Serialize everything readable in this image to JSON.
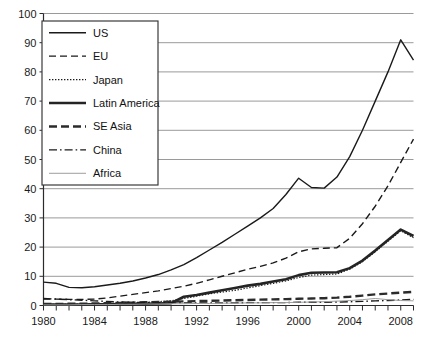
{
  "chart_data": {
    "type": "line",
    "title": "",
    "subtitle": "",
    "xlabel": "",
    "ylabel": "",
    "xlim": [
      1980,
      2009
    ],
    "ylim": [
      0,
      100
    ],
    "yticks": [
      0,
      10,
      20,
      30,
      40,
      50,
      60,
      70,
      80,
      90,
      100
    ],
    "ytick_labels": [
      "0",
      "10",
      "20",
      "30",
      "40",
      "50",
      "60",
      "70",
      "80",
      "90",
      "100"
    ],
    "xticks": [
      1980,
      1981,
      1982,
      1983,
      1984,
      1985,
      1986,
      1987,
      1988,
      1989,
      1990,
      1991,
      1992,
      1993,
      1994,
      1995,
      1996,
      1997,
      1998,
      1999,
      2000,
      2001,
      2002,
      2003,
      2004,
      2005,
      2006,
      2007,
      2008,
      2009
    ],
    "xtick_labels_shown": [
      "1980",
      "1984",
      "1988",
      "1992",
      "1996",
      "2000",
      "2004",
      "2008"
    ],
    "xtick_label_years": [
      1980,
      1984,
      1988,
      1992,
      1996,
      2000,
      2004,
      2008
    ],
    "grid": true,
    "grid_axis": "y",
    "legend_position": "top-left-inside",
    "x": [
      1980,
      1981,
      1982,
      1983,
      1984,
      1985,
      1986,
      1987,
      1988,
      1989,
      1990,
      1991,
      1992,
      1993,
      1994,
      1995,
      1996,
      1997,
      1998,
      1999,
      2000,
      2001,
      2002,
      2003,
      2004,
      2005,
      2006,
      2007,
      2008,
      2009
    ],
    "series": [
      {
        "name": "US",
        "dash": "none",
        "width": 1.4,
        "color": "#1a1a1a",
        "values": [
          8.0,
          7.6,
          6.2,
          6.1,
          6.4,
          7.0,
          7.6,
          8.4,
          9.4,
          10.6,
          12.2,
          14.0,
          16.4,
          19.0,
          21.6,
          24.4,
          27.2,
          30.0,
          33.2,
          38.0,
          43.6,
          40.4,
          40.2,
          44.0,
          51.0,
          60.0,
          70.0,
          80.0,
          91.0,
          84.0
        ]
      },
      {
        "name": "EU",
        "dash": "dashed",
        "width": 1.4,
        "color": "#1a1a1a",
        "values": [
          2.2,
          2.2,
          2.1,
          2.1,
          2.2,
          2.6,
          3.2,
          3.8,
          4.4,
          5.0,
          5.8,
          6.6,
          7.6,
          8.8,
          10.0,
          11.2,
          12.4,
          13.4,
          14.6,
          16.2,
          18.4,
          19.4,
          19.6,
          19.8,
          23.0,
          28.0,
          34.0,
          41.0,
          49.0,
          57.0
        ]
      },
      {
        "name": "Japan",
        "dash": "dotted",
        "width": 1.2,
        "color": "#1a1a1a",
        "values": [
          0.4,
          0.4,
          0.5,
          0.5,
          0.6,
          0.7,
          0.8,
          0.9,
          1.1,
          1.3,
          1.6,
          2.4,
          3.2,
          4.0,
          4.6,
          5.2,
          6.0,
          6.8,
          7.6,
          8.4,
          9.6,
          10.4,
          10.6,
          10.8,
          12.4,
          15.0,
          18.4,
          22.0,
          25.6,
          23.2
        ]
      },
      {
        "name": "Latin America",
        "dash": "none",
        "width": 2.6,
        "color": "#242424",
        "values": [
          0.3,
          0.3,
          0.3,
          0.3,
          0.4,
          0.4,
          0.5,
          0.5,
          0.6,
          0.7,
          0.8,
          3.0,
          3.6,
          4.4,
          5.2,
          6.0,
          6.8,
          7.4,
          8.2,
          9.0,
          10.4,
          11.2,
          11.3,
          11.4,
          12.8,
          15.4,
          18.8,
          22.4,
          26.0,
          23.8
        ]
      },
      {
        "name": "SE Asia",
        "dash": "thick-dashed",
        "width": 2.4,
        "color": "#2b2b2b",
        "values": [
          0.5,
          0.5,
          0.6,
          0.6,
          0.7,
          0.8,
          0.9,
          1.0,
          1.1,
          1.2,
          1.3,
          1.4,
          1.5,
          1.6,
          1.7,
          1.8,
          1.9,
          2.0,
          2.1,
          2.2,
          2.3,
          2.4,
          2.5,
          2.7,
          3.0,
          3.4,
          3.8,
          4.1,
          4.4,
          4.7
        ]
      },
      {
        "name": "China",
        "dash": "dashdot",
        "width": 1.4,
        "color": "#1a1a1a",
        "values": [
          2.4,
          2.2,
          2.0,
          1.8,
          1.6,
          1.4,
          1.2,
          1.1,
          1.0,
          1.0,
          0.9,
          0.9,
          0.9,
          0.9,
          0.9,
          0.9,
          1.0,
          1.0,
          1.0,
          1.0,
          1.1,
          1.1,
          1.1,
          1.2,
          1.3,
          1.4,
          1.6,
          1.7,
          1.9,
          2.1
        ]
      },
      {
        "name": "Africa",
        "dash": "none",
        "width": 1.0,
        "color": "#9d9d9d",
        "values": [
          0.2,
          0.2,
          0.2,
          0.3,
          0.3,
          0.3,
          0.4,
          0.4,
          0.5,
          0.5,
          0.6,
          0.6,
          0.7,
          0.7,
          0.8,
          0.8,
          0.9,
          0.9,
          1.0,
          1.0,
          1.1,
          1.2,
          1.3,
          1.5,
          1.7,
          2.0,
          2.4,
          2.0,
          1.7,
          1.6
        ]
      }
    ]
  },
  "legend": {
    "items": [
      {
        "label": "US"
      },
      {
        "label": "EU"
      },
      {
        "label": "Japan"
      },
      {
        "label": "Latin America"
      },
      {
        "label": "SE Asia"
      },
      {
        "label": "China"
      },
      {
        "label": "Africa"
      }
    ]
  }
}
